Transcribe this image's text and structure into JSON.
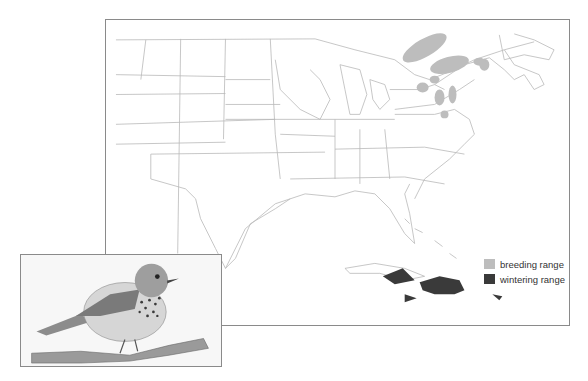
{
  "map": {
    "title": "Range map — eastern North America",
    "legend": [
      {
        "label": "breeding range",
        "color": "#bdbdbd"
      },
      {
        "label": "wintering range",
        "color": "#3a3a3a"
      }
    ]
  },
  "illustration": {
    "subject": "spotted-breast thrush perched on branch"
  },
  "colors": {
    "border": "#8a8a8a",
    "state_lines": "#b8b8b8",
    "breeding": "#bdbdbd",
    "wintering": "#3a3a3a"
  }
}
